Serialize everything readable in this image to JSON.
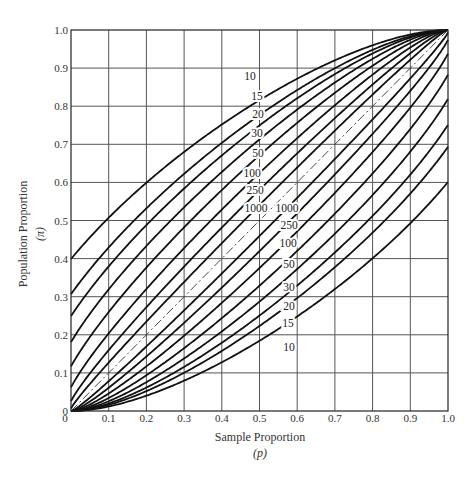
{
  "chart_data": {
    "type": "line",
    "title": "",
    "xlabel": "Sample Proportion",
    "xlabel_symbol": "(p)",
    "ylabel": "Population Proportion",
    "ylabel_symbol": "(π)",
    "xlim": [
      0,
      1.0
    ],
    "ylim": [
      0,
      1.0
    ],
    "grid": true,
    "legend": "none (curves labeled inline by sample size n)",
    "x_ticks": [
      "0",
      "0.1",
      "0.2",
      "0.3",
      "0.4",
      "0.5",
      "0.6",
      "0.7",
      "0.8",
      "0.9",
      "1.0"
    ],
    "y_ticks": [
      "0",
      "0.1",
      "0.2",
      "0.3",
      "0.4",
      "0.5",
      "0.6",
      "0.7",
      "0.8",
      "0.9",
      "1.0"
    ],
    "params": {
      "method": "wilson-score",
      "z": 2.576
    },
    "sample_sizes": [
      10,
      15,
      20,
      30,
      50,
      100,
      250,
      1000
    ],
    "x": [
      0,
      0.1,
      0.2,
      0.3,
      0.4,
      0.5,
      0.6,
      0.7,
      0.8,
      0.9,
      1.0
    ],
    "series": [
      {
        "name": "n=10 upper",
        "n": 10,
        "bound": "upper",
        "values": [
          0.399,
          0.507,
          0.599,
          0.68,
          0.752,
          0.816,
          0.872,
          0.92,
          0.96,
          0.988,
          1.0
        ]
      },
      {
        "name": "n=15 upper",
        "n": 15,
        "bound": "upper",
        "values": [
          0.307,
          0.429,
          0.532,
          0.622,
          0.704,
          0.777,
          0.842,
          0.9,
          0.948,
          0.984,
          1.0
        ]
      },
      {
        "name": "n=20 upper",
        "n": 20,
        "bound": "upper",
        "values": [
          0.249,
          0.38,
          0.488,
          0.584,
          0.671,
          0.75,
          0.821,
          0.884,
          0.939,
          0.98,
          1.0
        ]
      },
      {
        "name": "n=30 upper",
        "n": 30,
        "bound": "upper",
        "values": [
          0.181,
          0.319,
          0.433,
          0.535,
          0.627,
          0.713,
          0.791,
          0.862,
          0.924,
          0.974,
          1.0
        ]
      },
      {
        "name": "n=50 upper",
        "n": 50,
        "bound": "upper",
        "values": [
          0.117,
          0.26,
          0.376,
          0.482,
          0.58,
          0.671,
          0.756,
          0.835,
          0.906,
          0.966,
          1.0
        ]
      },
      {
        "name": "n=100 upper",
        "n": 100,
        "bound": "upper",
        "values": [
          0.062,
          0.204,
          0.32,
          0.427,
          0.529,
          0.625,
          0.716,
          0.803,
          0.883,
          0.954,
          1.0
        ]
      },
      {
        "name": "n=250 upper",
        "n": 250,
        "bound": "upper",
        "values": [
          0.026,
          0.16,
          0.273,
          0.379,
          0.481,
          0.58,
          0.676,
          0.769,
          0.857,
          0.939,
          1.0
        ]
      },
      {
        "name": "n=1000 upper",
        "n": 1000,
        "bound": "upper",
        "values": [
          0.007,
          0.127,
          0.235,
          0.339,
          0.44,
          0.541,
          0.639,
          0.736,
          0.831,
          0.922,
          1.0
        ]
      },
      {
        "name": "n=10 lower",
        "n": 10,
        "bound": "lower",
        "values": [
          0.0,
          0.012,
          0.04,
          0.08,
          0.128,
          0.184,
          0.248,
          0.32,
          0.401,
          0.493,
          0.601
        ]
      },
      {
        "name": "n=15 lower",
        "n": 15,
        "bound": "lower",
        "values": [
          0.0,
          0.016,
          0.052,
          0.1,
          0.158,
          0.223,
          0.296,
          0.378,
          0.468,
          0.571,
          0.693
        ]
      },
      {
        "name": "n=20 lower",
        "n": 20,
        "bound": "lower",
        "values": [
          0.0,
          0.02,
          0.061,
          0.116,
          0.179,
          0.25,
          0.329,
          0.416,
          0.512,
          0.62,
          0.751
        ]
      },
      {
        "name": "n=30 lower",
        "n": 30,
        "bound": "lower",
        "values": [
          0.0,
          0.026,
          0.076,
          0.138,
          0.209,
          0.287,
          0.373,
          0.465,
          0.567,
          0.681,
          0.819
        ]
      },
      {
        "name": "n=50 lower",
        "n": 50,
        "bound": "lower",
        "values": [
          0.0,
          0.034,
          0.094,
          0.165,
          0.244,
          0.329,
          0.42,
          0.518,
          0.624,
          0.74,
          0.883
        ]
      },
      {
        "name": "n=100 lower",
        "n": 100,
        "bound": "lower",
        "values": [
          0.0,
          0.046,
          0.117,
          0.197,
          0.284,
          0.375,
          0.471,
          0.573,
          0.68,
          0.796,
          0.938
        ]
      },
      {
        "name": "n=250 lower",
        "n": 250,
        "bound": "lower",
        "values": [
          0.0,
          0.061,
          0.143,
          0.231,
          0.324,
          0.42,
          0.519,
          0.621,
          0.727,
          0.84,
          0.974
        ]
      },
      {
        "name": "n=1000 lower",
        "n": 1000,
        "bound": "lower",
        "values": [
          0.0,
          0.078,
          0.169,
          0.264,
          0.361,
          0.459,
          0.56,
          0.661,
          0.765,
          0.873,
          0.993
        ]
      },
      {
        "name": "reference diagonal",
        "style": "dash-dot",
        "values": [
          0,
          0.1,
          0.2,
          0.3,
          0.4,
          0.5,
          0.6,
          0.7,
          0.8,
          0.9,
          1.0
        ]
      }
    ],
    "annotations": {
      "upper_labels": [
        {
          "text": "10",
          "x_px": 250,
          "y_px": 80
        },
        {
          "text": "15",
          "x_px": 257,
          "y_px": 100
        },
        {
          "text": "20",
          "x_px": 258,
          "y_px": 118
        },
        {
          "text": "30",
          "x_px": 257,
          "y_px": 137
        },
        {
          "text": "50",
          "x_px": 258,
          "y_px": 157
        },
        {
          "text": "100",
          "x_px": 252,
          "y_px": 177
        },
        {
          "text": "250",
          "x_px": 255,
          "y_px": 194
        },
        {
          "text": "1000",
          "x_px": 256,
          "y_px": 212
        }
      ],
      "lower_labels": [
        {
          "text": "1000",
          "x_px": 287,
          "y_px": 212
        },
        {
          "text": "250",
          "x_px": 289,
          "y_px": 229
        },
        {
          "text": "100",
          "x_px": 288,
          "y_px": 247
        },
        {
          "text": "50",
          "x_px": 289,
          "y_px": 268
        },
        {
          "text": "30",
          "x_px": 289,
          "y_px": 291
        },
        {
          "text": "20",
          "x_px": 289,
          "y_px": 310
        },
        {
          "text": "15",
          "x_px": 288,
          "y_px": 327
        },
        {
          "text": "10",
          "x_px": 289,
          "y_px": 351
        }
      ]
    }
  },
  "colors": {
    "background": "#ffffff",
    "grid": "#555555",
    "curve": "#111111",
    "text": "#333333"
  }
}
